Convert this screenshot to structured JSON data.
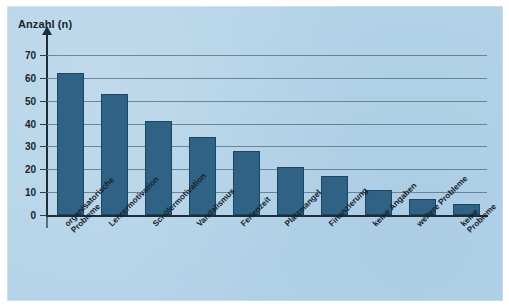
{
  "chart_data": {
    "type": "bar",
    "title": "Anzahl (n)",
    "xlabel": "",
    "ylabel": "Anzahl (n)",
    "ylim": [
      0,
      70
    ],
    "ytick_step": 10,
    "yticks": [
      0,
      10,
      20,
      30,
      40,
      50,
      60,
      70
    ],
    "grid": true,
    "legend": "none",
    "categories": [
      "organisatorische\nProbleme",
      "Lehrermotivation",
      "Schülermotivation",
      "Vandalismus",
      "Ferienzeit",
      "Platzmangel",
      "Finanzierung",
      "keine Angaben",
      "weitere Probleme",
      "keine Probleme"
    ],
    "values": [
      62,
      53,
      41,
      34,
      28,
      21,
      17,
      11,
      7,
      5
    ],
    "bar_color": "#2f6284",
    "bar_edge_color": "#1c4762",
    "background_color": "#b4d3e8",
    "gridline_color": "#5d7788",
    "axis_color": "#1d2d39",
    "text_color": "#16222c"
  },
  "figure": {
    "axis_title": "Anzahl (n)",
    "y_tick_labels": [
      "0",
      "10",
      "20",
      "30",
      "40",
      "50",
      "60",
      "70"
    ]
  }
}
